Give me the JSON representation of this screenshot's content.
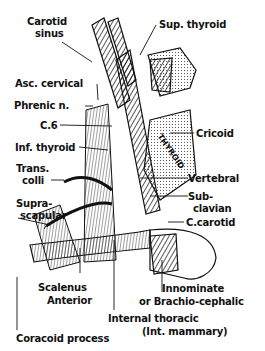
{
  "diagram": {
    "labels": {
      "carotid_sinus_1": "Carotid",
      "carotid_sinus_2": "sinus",
      "sup_thyroid": "Sup. thyroid",
      "asc_cervical": "Asc. cervical",
      "phrenic": "Phrenic n.",
      "c6": "C.6",
      "cricoid": "Cricoid",
      "inf_thyroid": "Inf. thyroid",
      "thyroid_gland": "THYROID",
      "trans_colli_1": "Trans.",
      "trans_colli_2": "colli",
      "vertebral": "Vertebral",
      "suprascapular_1": "Supra-",
      "suprascapular_2": "scapular",
      "subclavian_1": "Sub-",
      "subclavian_2": "clavian",
      "c_carotid": "C.carotid",
      "scalenus_1": "Scalenus",
      "scalenus_2": "Anterior",
      "innominate_1": "Innominate",
      "innominate_2": "or Brachio-cephalic",
      "internal_thoracic_1": "Internal thoracic",
      "internal_thoracic_2": "(Int. mammary)",
      "coracoid": "Coracoid process"
    }
  }
}
